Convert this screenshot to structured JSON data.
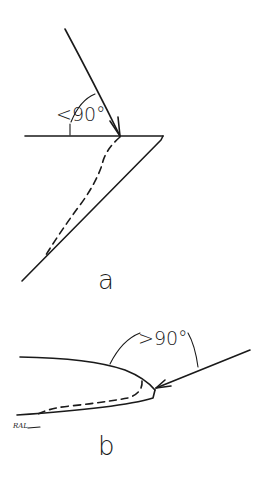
{
  "figure": {
    "panels": [
      {
        "id": "a",
        "label": "a",
        "angle_label": "<90°",
        "description": "Ray hitting a horizontal surface at an acute angle; sharp wedge with dashed inner path"
      },
      {
        "id": "b",
        "label": "b",
        "angle_label": ">90°",
        "description": "Ray hitting a rounded leading edge at an obtuse angle; dashed inner path to trailing tip"
      }
    ],
    "signature": "RAL",
    "colors": {
      "ink": "#1a1a1a",
      "background": "#ffffff"
    }
  }
}
